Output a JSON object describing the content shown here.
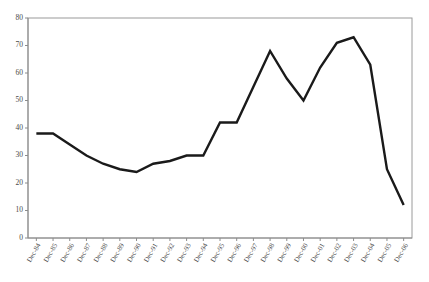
{
  "chart_data": {
    "type": "line",
    "title": "",
    "subtitle": "",
    "xlabel": "",
    "ylabel": "",
    "ylim": [
      0,
      80
    ],
    "ytick_step": 10,
    "yticks": [
      0,
      10,
      20,
      30,
      40,
      50,
      60,
      70,
      80
    ],
    "grid": false,
    "legend": null,
    "legend_position": "none",
    "line_color": "#1a1a1a",
    "axis_color": "#8c8c8c",
    "categories": [
      "Dec-84",
      "Dec-85",
      "Dec-86",
      "Dec-87",
      "Dec-88",
      "Dec-89",
      "Dec-90",
      "Dec-91",
      "Dec-92",
      "Dec-93",
      "Dec-94",
      "Dec-95",
      "Dec-96",
      "Dec-97",
      "Dec-98",
      "Dec-99",
      "Dec-00",
      "Dec-01",
      "Dec-02",
      "Dec-03",
      "Dec-04",
      "Dec-05",
      "Dec-06"
    ],
    "values": [
      38,
      38,
      34,
      30,
      27,
      25,
      24,
      27,
      28,
      30,
      30,
      42,
      42,
      55,
      68,
      58,
      50,
      62,
      71,
      73,
      63,
      25,
      12
    ]
  },
  "axis": {
    "y_min_label": "0",
    "y_max_label": "80"
  }
}
